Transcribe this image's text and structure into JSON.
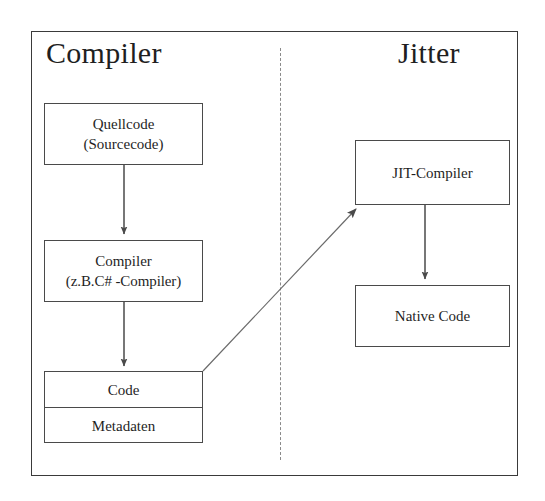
{
  "diagram": {
    "sections": [
      {
        "id": "compiler",
        "label": "Compiler"
      },
      {
        "id": "jitter",
        "label": "Jitter"
      }
    ],
    "divider": {
      "style": "dashed",
      "orientation": "vertical"
    },
    "nodes": {
      "quellcode": {
        "line1": "Quellcode",
        "line2": "(Sourcecode)"
      },
      "compiler": {
        "line1": "Compiler",
        "line2": "(z.B.C# -Compiler)"
      },
      "code_stack": {
        "top": "Code",
        "bottom": "Metadaten"
      },
      "jit_compiler": {
        "label": "JIT-Compiler"
      },
      "native_code": {
        "label": "Native Code"
      }
    },
    "edges": [
      {
        "id": "quellcode-to-compiler",
        "from": "quellcode",
        "to": "compiler",
        "kind": "arrow-down"
      },
      {
        "id": "compiler-to-code",
        "from": "compiler",
        "to": "code_stack",
        "kind": "arrow-down"
      },
      {
        "id": "code-to-jit",
        "from": "code_stack",
        "to": "jit_compiler",
        "kind": "arrow-diagonal"
      },
      {
        "id": "jit-to-native",
        "from": "jit_compiler",
        "to": "native_code",
        "kind": "arrow-down"
      }
    ],
    "colors": {
      "background": "#ffffff",
      "frame": "#3a3a3a",
      "box_border": "#4a4a4a",
      "divider": "#8a8a8a",
      "text": "#1f1f1f",
      "connector": "#555555"
    }
  }
}
